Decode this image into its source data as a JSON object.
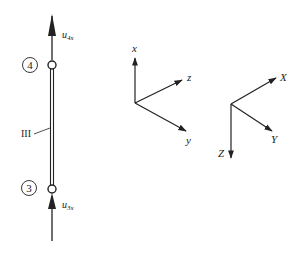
{
  "diagram": {
    "member": {
      "label": "III",
      "nodes": [
        {
          "id": "4",
          "label": "4"
        },
        {
          "id": "3",
          "label": "3"
        }
      ],
      "forces": [
        {
          "name": "u4x",
          "base": "u",
          "sub": "4x"
        },
        {
          "name": "u3x",
          "base": "u",
          "sub": "3x"
        }
      ]
    },
    "local_axes": {
      "x": "x",
      "y": "y",
      "z": "z"
    },
    "global_axes": {
      "X": "X",
      "Y": "Y",
      "Z": "Z"
    },
    "colors": {
      "stroke": "#222222",
      "background": "#ffffff"
    }
  }
}
